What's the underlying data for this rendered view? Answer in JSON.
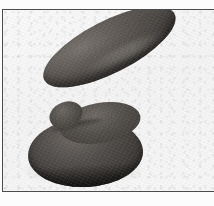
{
  "figure": {
    "kind": "photograph",
    "description": "Dark grey stone implement: an elongated tapered bar resting at an angle on a flat rounded disc base, photographed against a plain pale background.",
    "orientation": "handle tilts up toward the upper right",
    "caption": "",
    "label": ""
  },
  "frame": {
    "style": "thin single rule border, open at right",
    "rule_color": "#4b4b4b",
    "rule_width_px": 1.4
  },
  "background": {
    "paper_color": "#fcfcfc",
    "field_color": "#f6f6f6",
    "texture": "fine paper grain"
  },
  "artifact": {
    "parts": [
      {
        "name": "handle",
        "shape": "elongated ellipse, tapered to a rounded point at the upper right",
        "tilt_degrees": -27,
        "color": "#4a4643"
      },
      {
        "name": "disc-base",
        "shape": "flattened circular disc seen in perspective",
        "tilt_degrees": -3,
        "color": "#433f3c"
      },
      {
        "name": "shoulder",
        "shape": "rounded junction between handle and disc",
        "color": "#504c48"
      }
    ],
    "surface": "matte, finely pitted stone",
    "highlight_color": "#a8a49e",
    "shadow_color": "#12110f"
  }
}
